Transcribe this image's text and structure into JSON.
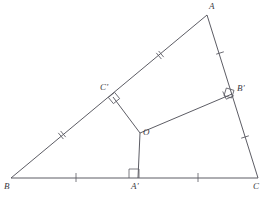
{
  "figure": {
    "kind": "euclidean-geometry-diagram",
    "canvas": {
      "width": 269,
      "height": 202
    },
    "stroke_color": "#4a4a52",
    "tick_color": "#5a5a62",
    "background_color": "#ffffff"
  },
  "points": {
    "A": {
      "label": "A",
      "x": 207,
      "y": 15,
      "label_x": 209,
      "label_y": 3,
      "interactable": false
    },
    "B": {
      "label": "B",
      "x": 11,
      "y": 178,
      "label_x": 5,
      "label_y": 183,
      "interactable": false
    },
    "C": {
      "label": "C",
      "x": 258,
      "y": 178,
      "label_x": 254,
      "label_y": 183,
      "interactable": false
    },
    "O": {
      "label": "O",
      "x": 140,
      "y": 133,
      "label_x": 143,
      "label_y": 133,
      "interactable": false
    },
    "Ap": {
      "label": "A'",
      "x": 138,
      "y": 178,
      "label_x": 132,
      "label_y": 183,
      "interactable": false
    },
    "Bp": {
      "label": "B'",
      "x": 232,
      "y": 94,
      "label_x": 237,
      "label_y": 86,
      "interactable": false
    },
    "Cp": {
      "label": "C'",
      "x": 113,
      "y": 97,
      "label_x": 101,
      "label_y": 85,
      "interactable": false
    }
  },
  "segments": [
    {
      "name": "side-ab",
      "from": "B",
      "to": "A",
      "note": "side AB through midpoint C'"
    },
    {
      "name": "side-ac",
      "from": "A",
      "to": "C",
      "note": "side AC through midpoint B'"
    },
    {
      "name": "side-bc",
      "from": "B",
      "to": "C",
      "note": "base BC through midpoint A'"
    },
    {
      "name": "bisector-oap",
      "from": "O",
      "to": "Ap",
      "note": "perpendicular bisector of BC"
    },
    {
      "name": "bisector-obp",
      "from": "O",
      "to": "Bp",
      "note": "perpendicular bisector of AC"
    },
    {
      "name": "bisector-ocp",
      "from": "O",
      "to": "Cp",
      "note": "perpendicular bisector of AB"
    }
  ],
  "tick_marks": [
    {
      "name": "tick-b-to-cp",
      "segment": "side-ab",
      "count": 2,
      "x": 62,
      "y": 135
    },
    {
      "name": "tick-cp-to-a",
      "segment": "side-ab",
      "count": 2,
      "x": 160,
      "y": 55
    },
    {
      "name": "tick-a-to-bp",
      "segment": "side-ac",
      "count": 1,
      "x": 220,
      "y": 53
    },
    {
      "name": "tick-bp-to-c",
      "segment": "side-ac",
      "count": 1,
      "x": 245,
      "y": 137
    },
    {
      "name": "tick-b-to-ap",
      "segment": "side-bc",
      "count": 1,
      "x": 76,
      "y": 178
    },
    {
      "name": "tick-ap-to-c",
      "segment": "side-bc",
      "count": 1,
      "x": 198,
      "y": 178
    }
  ],
  "right_angle_marks": [
    {
      "name": "right-angle-at-a-prime",
      "at": "Ap",
      "size": 9
    },
    {
      "name": "right-angle-at-b-prime",
      "at": "Bp",
      "size": 8
    },
    {
      "name": "right-angle-at-c-prime",
      "at": "Cp",
      "size": 8
    }
  ]
}
